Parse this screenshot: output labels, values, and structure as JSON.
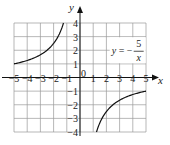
{
  "chart_data": {
    "type": "line",
    "title": "",
    "function": "y = -5/x",
    "annotation": {
      "lhs": "y",
      "equals": "=",
      "sign": "−",
      "numerator": "5",
      "denominator": "x",
      "position": {
        "x": 2.4,
        "y": 2
      }
    },
    "xlabel": "x",
    "ylabel": "y",
    "origin_label": "0",
    "xlim": [
      -5,
      5
    ],
    "ylim": [
      -4,
      4
    ],
    "grid": true,
    "x_ticks": [
      -5,
      -4,
      -3,
      -2,
      -1,
      1,
      2,
      3,
      4,
      5
    ],
    "x_tick_labels": [
      "−5",
      "−4",
      "−3",
      "−2",
      "−1",
      "1",
      "2",
      "3",
      "4",
      "5"
    ],
    "y_ticks": [
      4,
      3,
      2,
      1,
      -1,
      -2,
      -3,
      -4
    ],
    "y_tick_labels": [
      "4",
      "3",
      "2",
      "1",
      "−1",
      "−2",
      "−3",
      "−4"
    ],
    "series": [
      {
        "name": "left branch",
        "x": [
          -5,
          -4,
          -3,
          -2.5,
          -2,
          -1.5,
          -1.25
        ],
        "y": [
          1,
          1.25,
          1.667,
          2,
          2.5,
          3.333,
          4
        ]
      },
      {
        "name": "right branch",
        "x": [
          1.25,
          1.5,
          2,
          2.5,
          3,
          4,
          5
        ],
        "y": [
          -4,
          -3.333,
          -2.5,
          -2,
          -1.667,
          -1.25,
          -1
        ]
      }
    ],
    "colors": {
      "grid": "#9a9a9a",
      "axis": "#111111",
      "curve": "#111111"
    }
  }
}
